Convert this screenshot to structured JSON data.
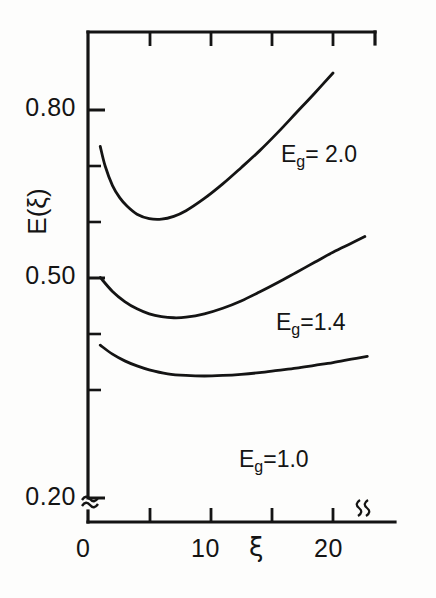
{
  "figure": {
    "background_color": "#fdfdfc",
    "ink_color": "#141414"
  },
  "axes": {
    "y_title": "E(ξ)",
    "x_title": "ξ",
    "y_tick_labels": [
      "0.80",
      "0.50",
      "0.20"
    ],
    "x_tick_labels": [
      "0",
      "10",
      "20"
    ],
    "y_axis_break_symbol": "≈"
  },
  "chart_data": {
    "type": "line",
    "title": "",
    "xlabel": "ξ",
    "ylabel": "E(ξ)",
    "xlim": [
      0,
      23.5
    ],
    "ylim": [
      0.2,
      0.875
    ],
    "grid": false,
    "legend": "inline-curve-labels",
    "y_ticks": [
      0.2,
      0.5,
      0.8
    ],
    "y_minor_ticks": [
      0.3,
      0.4,
      0.6,
      0.7
    ],
    "x_ticks": [
      0,
      5,
      10,
      15,
      20
    ],
    "y_axis_break_between": [
      0.2,
      0.3
    ],
    "series": [
      {
        "name": "E_g = 2.0",
        "label": "E_g= 2.0",
        "label_base": "E",
        "label_sub": "g",
        "label_value": "= 2.0",
        "x": [
          1.0,
          1.4,
          2.0,
          2.6,
          3.2,
          4.0,
          5.0,
          6.0,
          7.0,
          8.0,
          9.5,
          11.0,
          12.5,
          14.0,
          15.5,
          17.0,
          18.5,
          20.0
        ],
        "y": [
          0.735,
          0.7,
          0.665,
          0.643,
          0.628,
          0.614,
          0.606,
          0.605,
          0.61,
          0.62,
          0.642,
          0.668,
          0.697,
          0.727,
          0.76,
          0.795,
          0.83,
          0.866
        ]
      },
      {
        "name": "E_g = 1.4",
        "label": "E_g=1.4",
        "label_base": "E",
        "label_sub": "g",
        "label_value": "=1.4",
        "x": [
          1.0,
          2.0,
          3.0,
          4.0,
          5.0,
          6.0,
          7.0,
          8.0,
          9.5,
          11.0,
          12.5,
          14.0,
          15.5,
          17.0,
          18.5,
          20.0,
          21.5,
          22.6
        ],
        "y": [
          0.501,
          0.476,
          0.458,
          0.445,
          0.436,
          0.431,
          0.429,
          0.43,
          0.436,
          0.446,
          0.459,
          0.475,
          0.492,
          0.51,
          0.528,
          0.546,
          0.562,
          0.574
        ]
      },
      {
        "name": "E_g = 1.0",
        "label": "E_g =1.0",
        "label_base": "E",
        "label_sub": "g",
        "label_value": "=1.0",
        "x": [
          1.0,
          2.0,
          3.0,
          4.0,
          5.0,
          6.5,
          8.0,
          9.5,
          11.0,
          12.5,
          14.0,
          15.5,
          17.0,
          18.5,
          20.0,
          21.5,
          22.8
        ],
        "y": [
          0.38,
          0.364,
          0.352,
          0.343,
          0.336,
          0.329,
          0.326,
          0.325,
          0.326,
          0.328,
          0.331,
          0.335,
          0.339,
          0.344,
          0.349,
          0.355,
          0.36
        ]
      }
    ]
  },
  "labels": {
    "curve_top": "E_g= 2.0",
    "curve_middle": "E_g=1.4",
    "curve_bottom": "E_g =1.0"
  }
}
